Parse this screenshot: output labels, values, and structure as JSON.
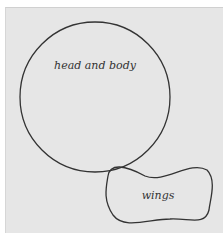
{
  "diagram": {
    "shapes": [
      {
        "id": "circle",
        "label": "head and body",
        "type": "circle"
      },
      {
        "id": "wings",
        "label": "wings",
        "type": "blob"
      }
    ],
    "colors": {
      "background": "#e6e6e6",
      "stroke": "#333333"
    }
  }
}
